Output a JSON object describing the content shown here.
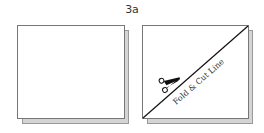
{
  "title": "3a",
  "panels": [
    {
      "name": "square-plain"
    },
    {
      "name": "square-cut",
      "label": "Fold & Cut Line",
      "icon": "scissors-icon"
    }
  ],
  "colors": {
    "line": "#111111",
    "border": "#777777",
    "shadow": "#d4d4d4"
  }
}
